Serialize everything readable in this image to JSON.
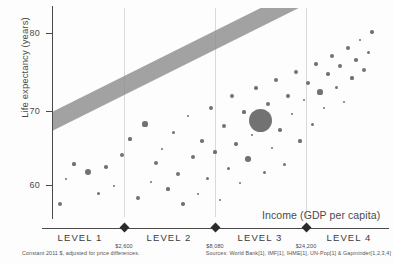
{
  "chart_data": {
    "type": "scatter",
    "title": "",
    "xlabel": "Income (GDP per capita)",
    "ylabel": "Life expectancy (years)",
    "x_scale": "log",
    "ylim": [
      52,
      86
    ],
    "yticks": [
      60,
      70,
      80
    ],
    "ytick_labels": [
      "60",
      "70",
      "80"
    ],
    "grid": "vertical-only",
    "legend": "none",
    "annotations": {
      "trend_band": "diagonal grey band showing positive correlation between income and life expectancy"
    },
    "level_boundaries": [
      {
        "label": "$2,600",
        "value": 2600
      },
      {
        "label": "$8,080",
        "value": 8080
      },
      {
        "label": "$24,200",
        "value": 24200
      }
    ],
    "level_bands": [
      "LEVEL 1",
      "LEVEL 2",
      "LEVEL 3",
      "LEVEL 4"
    ],
    "bubble_encoding": "bubble area = population",
    "points": [
      {
        "x": 8,
        "y": 196,
        "r": 2.0
      },
      {
        "x": 14,
        "y": 171,
        "r": 1.4
      },
      {
        "x": 22,
        "y": 156,
        "r": 1.6
      },
      {
        "x": 36,
        "y": 164,
        "r": 3.4
      },
      {
        "x": 46,
        "y": 185,
        "r": 1.5
      },
      {
        "x": 54,
        "y": 159,
        "r": 1.8
      },
      {
        "x": 62,
        "y": 178,
        "r": 1.3
      },
      {
        "x": 70,
        "y": 147,
        "r": 2.0
      },
      {
        "x": 78,
        "y": 131,
        "r": 1.6
      },
      {
        "x": 86,
        "y": 190,
        "r": 1.9
      },
      {
        "x": 93,
        "y": 116,
        "r": 2.6
      },
      {
        "x": 99,
        "y": 174,
        "r": 1.4
      },
      {
        "x": 104,
        "y": 155,
        "r": 2.2
      },
      {
        "x": 110,
        "y": 141,
        "r": 1.3
      },
      {
        "x": 116,
        "y": 181,
        "r": 1.6
      },
      {
        "x": 121,
        "y": 124,
        "r": 1.5
      },
      {
        "x": 126,
        "y": 166,
        "r": 2.4
      },
      {
        "x": 131,
        "y": 196,
        "r": 1.7
      },
      {
        "x": 136,
        "y": 108,
        "r": 1.3
      },
      {
        "x": 141,
        "y": 149,
        "r": 2.0
      },
      {
        "x": 146,
        "y": 186,
        "r": 1.4
      },
      {
        "x": 150,
        "y": 133,
        "r": 1.8
      },
      {
        "x": 155,
        "y": 170,
        "r": 1.5
      },
      {
        "x": 159,
        "y": 100,
        "r": 2.3
      },
      {
        "x": 163,
        "y": 144,
        "r": 1.6
      },
      {
        "x": 168,
        "y": 192,
        "r": 1.4
      },
      {
        "x": 172,
        "y": 118,
        "r": 1.9
      },
      {
        "x": 176,
        "y": 160,
        "r": 1.5
      },
      {
        "x": 180,
        "y": 88,
        "r": 2.1
      },
      {
        "x": 184,
        "y": 136,
        "r": 1.7
      },
      {
        "x": 188,
        "y": 175,
        "r": 1.3
      },
      {
        "x": 192,
        "y": 104,
        "r": 1.6
      },
      {
        "x": 196,
        "y": 151,
        "r": 2.8
      },
      {
        "x": 200,
        "y": 127,
        "r": 1.4
      },
      {
        "x": 204,
        "y": 80,
        "r": 1.8
      },
      {
        "x": 208,
        "y": 112,
        "r": 11.5
      },
      {
        "x": 212,
        "y": 164,
        "r": 1.5
      },
      {
        "x": 216,
        "y": 96,
        "r": 2.0
      },
      {
        "x": 220,
        "y": 140,
        "r": 1.3
      },
      {
        "x": 224,
        "y": 72,
        "r": 2.4
      },
      {
        "x": 228,
        "y": 122,
        "r": 1.7
      },
      {
        "x": 232,
        "y": 156,
        "r": 1.5
      },
      {
        "x": 236,
        "y": 88,
        "r": 1.9
      },
      {
        "x": 240,
        "y": 106,
        "r": 1.4
      },
      {
        "x": 244,
        "y": 64,
        "r": 2.2
      },
      {
        "x": 248,
        "y": 133,
        "r": 1.6
      },
      {
        "x": 252,
        "y": 92,
        "r": 1.3
      },
      {
        "x": 256,
        "y": 75,
        "r": 2.0
      },
      {
        "x": 260,
        "y": 116,
        "r": 1.5
      },
      {
        "x": 264,
        "y": 56,
        "r": 1.8
      },
      {
        "x": 268,
        "y": 84,
        "r": 2.6
      },
      {
        "x": 272,
        "y": 100,
        "r": 1.4
      },
      {
        "x": 276,
        "y": 66,
        "r": 1.7
      },
      {
        "x": 280,
        "y": 48,
        "r": 2.1
      },
      {
        "x": 284,
        "y": 79,
        "r": 1.5
      },
      {
        "x": 288,
        "y": 58,
        "r": 1.9
      },
      {
        "x": 292,
        "y": 94,
        "r": 1.3
      },
      {
        "x": 296,
        "y": 40,
        "r": 2.3
      },
      {
        "x": 300,
        "y": 70,
        "r": 1.6
      },
      {
        "x": 304,
        "y": 52,
        "r": 1.8
      },
      {
        "x": 308,
        "y": 32,
        "r": 1.4
      },
      {
        "x": 312,
        "y": 62,
        "r": 2.0
      },
      {
        "x": 316,
        "y": 44,
        "r": 1.5
      },
      {
        "x": 320,
        "y": 24,
        "r": 1.7
      }
    ]
  },
  "axes": {
    "y_title": "Life expectancy (years)",
    "x_title": "Income (GDP per capita)",
    "y_ticks": [
      {
        "label": "80",
        "top": 33
      },
      {
        "label": "70",
        "top": 111
      },
      {
        "label": "60",
        "top": 185
      }
    ]
  },
  "levels": [
    {
      "label": "LEVEL 1",
      "center": 80,
      "boundary": null,
      "boundary_x": null
    },
    {
      "label": "LEVEL 2",
      "center": 169,
      "boundary": "$2,600",
      "boundary_x": 124
    },
    {
      "label": "LEVEL 3",
      "center": 260,
      "boundary": "$8,080",
      "boundary_x": 215
    },
    {
      "label": "LEVEL 4",
      "center": 349,
      "boundary": "$24,200",
      "boundary_x": 306
    }
  ],
  "footnotes": {
    "left": "Constant 2011 $, adjusted for price differences.",
    "right": "Sources: World Bank[1], IMF[1], IHME[1], UN-Pop[1] & Gapminder[1,2,3,4]"
  },
  "colors": {
    "bubble": "#5e5e5e",
    "trend_band": "#8e8e8e",
    "axis": "#4a4a4a",
    "gridline": "#d9d9d9",
    "background": "#fdfdfd"
  }
}
